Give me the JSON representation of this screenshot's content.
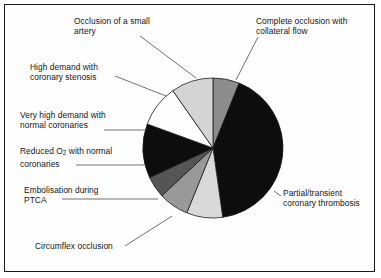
{
  "figure": {
    "title": "",
    "background_color": "#ffffff",
    "border_color": "#1a1a1a"
  },
  "chart_data": {
    "type": "pie",
    "title": "",
    "xlabel": "",
    "ylabel": "",
    "legend_position": "callout-labels",
    "grid": false,
    "start_angle_deg": 0,
    "direction": "clockwise",
    "center": {
      "x": 213,
      "y": 148
    },
    "radius": 70,
    "categories": [
      "Complete occlusion with collateral flow",
      "Partial/transient coronary thrombosis",
      "Circumflex occlusion",
      "Embolisation during PTCA",
      "Reduced O2 with normal coronaries",
      "Very high demand with normal coronaries",
      "High demand with coronary stenosis",
      "Occlusion of a small artery"
    ],
    "values": [
      6.1,
      41.7,
      8.3,
      6.9,
      5.0,
      12.5,
      9.7,
      9.8
    ],
    "angles_deg": [
      22,
      150,
      30,
      25,
      18,
      45,
      35,
      35
    ],
    "colors": [
      "#8c8c8c",
      "#0d0d0d",
      "#d9d9d9",
      "#999999",
      "#555555",
      "#0d0d0d",
      "#fdfdfd",
      "#d4d4d4"
    ],
    "slices": [
      {
        "label": "Complete occlusion with collateral flow",
        "value": 6.1,
        "start_deg": 0,
        "end_deg": 22,
        "color": "#8c8c8c"
      },
      {
        "label": "Partial/transient coronary thrombosis",
        "value": 41.7,
        "start_deg": 22,
        "end_deg": 172,
        "color": "#0d0d0d"
      },
      {
        "label": "Circumflex occlusion",
        "value": 8.3,
        "start_deg": 172,
        "end_deg": 202,
        "color": "#d9d9d9"
      },
      {
        "label": "Embolisation during PTCA",
        "value": 6.9,
        "start_deg": 202,
        "end_deg": 227,
        "color": "#999999"
      },
      {
        "label": "Reduced O2 with normal coronaries",
        "value": 5.0,
        "start_deg": 227,
        "end_deg": 245,
        "color": "#555555"
      },
      {
        "label": "Very high demand with normal coronaries",
        "value": 12.5,
        "start_deg": 245,
        "end_deg": 290,
        "color": "#0d0d0d"
      },
      {
        "label": "High demand with coronary stenosis",
        "value": 9.7,
        "start_deg": 290,
        "end_deg": 325,
        "color": "#fdfdfd"
      },
      {
        "label": "Occlusion of a small artery",
        "value": 9.8,
        "start_deg": 325,
        "end_deg": 360,
        "color": "#d4d4d4"
      }
    ]
  },
  "labels": {
    "occlusion_small_artery": "Occlusion of a small\nartery",
    "complete_occlusion": "Complete occlusion with\ncollateral flow",
    "high_demand_stenosis": "High demand with\ncoronary stenosis",
    "very_high_demand": "Very high demand with\nnormal coronaries",
    "reduced_o2_line1": "Reduced O",
    "reduced_o2_sub": "2",
    "reduced_o2_line2": " with normal",
    "reduced_o2_line3": "coronaries",
    "embolisation_ptca": "Embolisation during\nPTCA",
    "circumflex_occlusion": "Circumflex occlusion",
    "partial_transient": "Partial/transient\ncoronary thrombosis"
  }
}
